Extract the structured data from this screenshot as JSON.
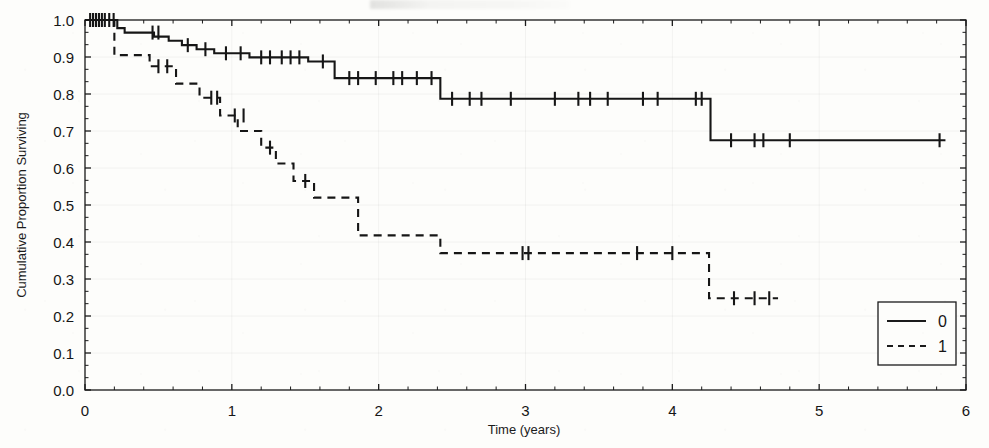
{
  "figure": {
    "caption_partial": "",
    "background_hex": "#fdfdfb",
    "ink_hex": "#1b1b1b"
  },
  "chart_data": {
    "type": "line",
    "subtype": "kaplan-meier-step",
    "title": "",
    "xlabel": "Time (years)",
    "ylabel": "Cumulative Proportion Surviving",
    "xlim": [
      0,
      6
    ],
    "ylim": [
      0.0,
      1.0
    ],
    "xticks": [
      0,
      1,
      2,
      3,
      4,
      5,
      6
    ],
    "xtick_labels": [
      "0",
      "1",
      "2",
      "3",
      "4",
      "5",
      "6"
    ],
    "yticks": [
      0.0,
      0.1,
      0.2,
      0.3,
      0.4,
      0.5,
      0.6,
      0.7,
      0.8,
      0.9,
      1.0
    ],
    "ytick_labels": [
      "0.0",
      "0.1",
      "0.2",
      "0.3",
      "0.4",
      "0.5",
      "0.6",
      "0.7",
      "0.8",
      "0.9",
      "1.0"
    ],
    "minor_ticks_per_major_y": 2,
    "minor_ticks_per_major_x": 4,
    "grid": false,
    "legend": {
      "position": "bottom-right",
      "entries": [
        {
          "label": "0",
          "style": "solid"
        },
        {
          "label": "1",
          "style": "dashed"
        }
      ]
    },
    "series": [
      {
        "name": "0",
        "style": "solid",
        "color": "#161616",
        "steps": [
          [
            0.0,
            1.0
          ],
          [
            0.22,
            1.0
          ],
          [
            0.22,
            0.978
          ],
          [
            0.27,
            0.978
          ],
          [
            0.27,
            0.966
          ],
          [
            0.47,
            0.966
          ],
          [
            0.47,
            0.955
          ],
          [
            0.57,
            0.955
          ],
          [
            0.57,
            0.944
          ],
          [
            0.66,
            0.944
          ],
          [
            0.66,
            0.932
          ],
          [
            0.76,
            0.932
          ],
          [
            0.76,
            0.921
          ],
          [
            0.88,
            0.921
          ],
          [
            0.88,
            0.91
          ],
          [
            1.12,
            0.91
          ],
          [
            1.12,
            0.899
          ],
          [
            1.52,
            0.899
          ],
          [
            1.52,
            0.888
          ],
          [
            1.7,
            0.888
          ],
          [
            1.7,
            0.843
          ],
          [
            2.42,
            0.843
          ],
          [
            2.42,
            0.787
          ],
          [
            4.26,
            0.787
          ],
          [
            4.26,
            0.675
          ],
          [
            5.86,
            0.675
          ]
        ],
        "censored": [
          [
            0.035,
            1.0
          ],
          [
            0.055,
            1.0
          ],
          [
            0.075,
            1.0
          ],
          [
            0.095,
            1.0
          ],
          [
            0.115,
            1.0
          ],
          [
            0.135,
            1.0
          ],
          [
            0.165,
            1.0
          ],
          [
            0.195,
            1.0
          ],
          [
            0.46,
            0.966
          ],
          [
            0.5,
            0.966
          ],
          [
            0.7,
            0.932
          ],
          [
            0.82,
            0.921
          ],
          [
            0.96,
            0.91
          ],
          [
            1.06,
            0.91
          ],
          [
            1.2,
            0.899
          ],
          [
            1.26,
            0.899
          ],
          [
            1.34,
            0.899
          ],
          [
            1.4,
            0.899
          ],
          [
            1.46,
            0.899
          ],
          [
            1.62,
            0.888
          ],
          [
            1.8,
            0.843
          ],
          [
            1.86,
            0.843
          ],
          [
            1.98,
            0.843
          ],
          [
            2.1,
            0.843
          ],
          [
            2.16,
            0.843
          ],
          [
            2.26,
            0.843
          ],
          [
            2.36,
            0.843
          ],
          [
            2.5,
            0.787
          ],
          [
            2.62,
            0.787
          ],
          [
            2.7,
            0.787
          ],
          [
            2.9,
            0.787
          ],
          [
            3.2,
            0.787
          ],
          [
            3.36,
            0.787
          ],
          [
            3.44,
            0.787
          ],
          [
            3.56,
            0.787
          ],
          [
            3.8,
            0.787
          ],
          [
            3.9,
            0.787
          ],
          [
            4.16,
            0.787
          ],
          [
            4.2,
            0.787
          ],
          [
            4.4,
            0.675
          ],
          [
            4.56,
            0.675
          ],
          [
            4.62,
            0.675
          ],
          [
            4.8,
            0.675
          ],
          [
            5.82,
            0.675
          ]
        ]
      },
      {
        "name": "1",
        "style": "dashed",
        "color": "#161616",
        "steps": [
          [
            0.0,
            1.0
          ],
          [
            0.2,
            1.0
          ],
          [
            0.2,
            0.905
          ],
          [
            0.44,
            0.905
          ],
          [
            0.44,
            0.875
          ],
          [
            0.62,
            0.875
          ],
          [
            0.62,
            0.828
          ],
          [
            0.78,
            0.828
          ],
          [
            0.78,
            0.79
          ],
          [
            0.92,
            0.79
          ],
          [
            0.92,
            0.742
          ],
          [
            1.04,
            0.742
          ],
          [
            1.04,
            0.7
          ],
          [
            1.2,
            0.7
          ],
          [
            1.2,
            0.655
          ],
          [
            1.3,
            0.655
          ],
          [
            1.3,
            0.612
          ],
          [
            1.42,
            0.612
          ],
          [
            1.42,
            0.565
          ],
          [
            1.56,
            0.565
          ],
          [
            1.56,
            0.52
          ],
          [
            1.86,
            0.52
          ],
          [
            1.86,
            0.418
          ],
          [
            2.42,
            0.418
          ],
          [
            2.42,
            0.37
          ],
          [
            4.25,
            0.37
          ],
          [
            4.25,
            0.248
          ],
          [
            4.72,
            0.248
          ]
        ],
        "censored": [
          [
            0.5,
            0.875
          ],
          [
            0.56,
            0.875
          ],
          [
            0.86,
            0.79
          ],
          [
            0.9,
            0.79
          ],
          [
            1.02,
            0.742
          ],
          [
            1.08,
            0.742
          ],
          [
            1.26,
            0.655
          ],
          [
            1.5,
            0.565
          ],
          [
            2.98,
            0.37
          ],
          [
            3.02,
            0.37
          ],
          [
            3.76,
            0.37
          ],
          [
            4.0,
            0.37
          ],
          [
            4.42,
            0.248
          ],
          [
            4.56,
            0.248
          ],
          [
            4.66,
            0.248
          ]
        ]
      }
    ]
  }
}
